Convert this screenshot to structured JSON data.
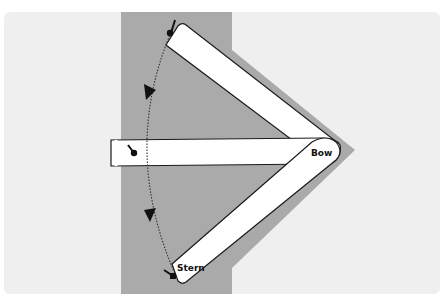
{
  "diagram": {
    "labels": {
      "bow": "Bow",
      "stern": "Stern"
    },
    "positions": [
      {
        "name": "start",
        "description": "Boat angled up-left, stern at top"
      },
      {
        "name": "middle",
        "description": "Boat horizontal, stern at left"
      },
      {
        "name": "end",
        "description": "Boat angled down-left, stern at bottom"
      }
    ],
    "arc": {
      "style": "dotted",
      "arrows": 2,
      "direction": "downward"
    },
    "colors": {
      "background": "#ffffff",
      "card": "#efefef",
      "water_zone": "#aaaaaa",
      "boat_fill": "#ffffff",
      "boat_outline": "#1a1a1a",
      "arc": "#333333"
    }
  }
}
